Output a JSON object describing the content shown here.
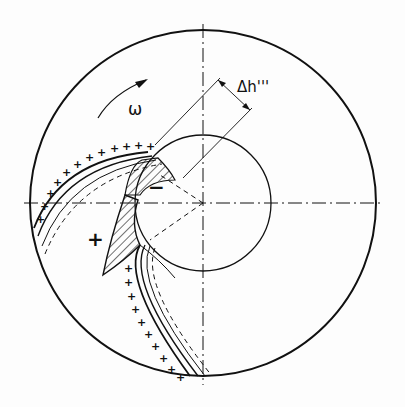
{
  "diagram": {
    "labels": {
      "omega": "ω",
      "delta_h": "Δh'''",
      "plus_sign": "+",
      "minus_sign": "−"
    },
    "colors": {
      "ink": "#111111",
      "background": "#fdfdfd"
    }
  }
}
